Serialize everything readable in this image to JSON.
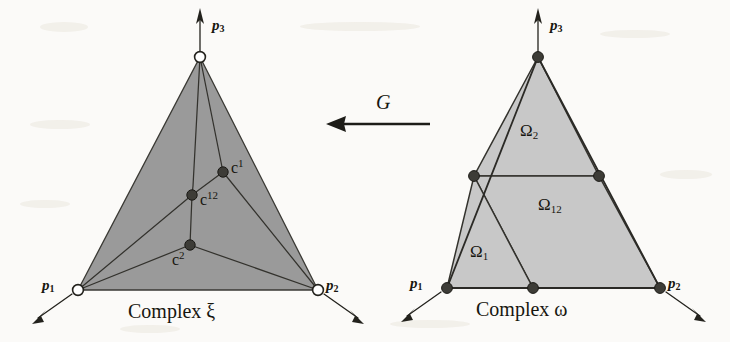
{
  "figure": {
    "kind": "mathematical-diagram",
    "background_color": "#fbfaf8",
    "map_arrow_label": "G",
    "left_panel": {
      "caption": "Complex ξ",
      "fill_color": "#9a9a9a",
      "stroke_color": "#2b2a26",
      "vertex_marker_style": "hollow-circle",
      "outer_vertices": [
        {
          "name": "p3",
          "label": "p",
          "subscript": "3",
          "x": 200,
          "y": 57,
          "label_x": 212,
          "label_y": 18
        },
        {
          "name": "p1",
          "label": "p",
          "subscript": "1",
          "x": 78,
          "y": 290,
          "label_x": 42,
          "label_y": 278
        },
        {
          "name": "p2",
          "label": "p",
          "subscript": "2",
          "x": 318,
          "y": 290,
          "label_x": 326,
          "label_y": 278
        }
      ],
      "interior_nodes": [
        {
          "name": "c1",
          "label": "c",
          "superscript": "1",
          "x": 223,
          "y": 172,
          "label_x": 231,
          "label_y": 158
        },
        {
          "name": "c12",
          "label": "c",
          "superscript": "12",
          "x": 192,
          "y": 195,
          "label_x": 200,
          "label_y": 190
        },
        {
          "name": "c2",
          "label": "c",
          "superscript": "2",
          "x": 190,
          "y": 245,
          "label_x": 172,
          "label_y": 250
        }
      ]
    },
    "right_panel": {
      "caption": "Complex ω",
      "fill_color": "#c8c8c8",
      "stroke_color": "#2b2a26",
      "vertex_marker_style": "filled-dot",
      "outer_vertices": [
        {
          "name": "p3",
          "label": "p",
          "subscript": "3",
          "x": 538,
          "y": 57,
          "label_x": 550,
          "label_y": 18
        },
        {
          "name": "p1",
          "label": "p",
          "subscript": "1",
          "x": 447,
          "y": 288,
          "label_x": 410,
          "label_y": 276
        },
        {
          "name": "p2",
          "label": "p",
          "subscript": "2",
          "x": 660,
          "y": 288,
          "label_x": 668,
          "label_y": 276
        }
      ],
      "edge_nodes": [
        {
          "name": "left-midpoint",
          "x": 474,
          "y": 176
        },
        {
          "name": "right-midpoint",
          "x": 599,
          "y": 176
        },
        {
          "name": "bottom-midpoint",
          "x": 533,
          "y": 288
        }
      ],
      "regions": [
        {
          "name": "omega-2",
          "label": "Ω",
          "subscript": "2",
          "label_x": 520,
          "label_y": 122
        },
        {
          "name": "omega-12",
          "label": "Ω",
          "subscript": "12",
          "label_x": 538,
          "label_y": 196
        },
        {
          "name": "omega-1",
          "label": "Ω",
          "subscript": "1",
          "label_x": 470,
          "label_y": 243
        }
      ]
    }
  }
}
